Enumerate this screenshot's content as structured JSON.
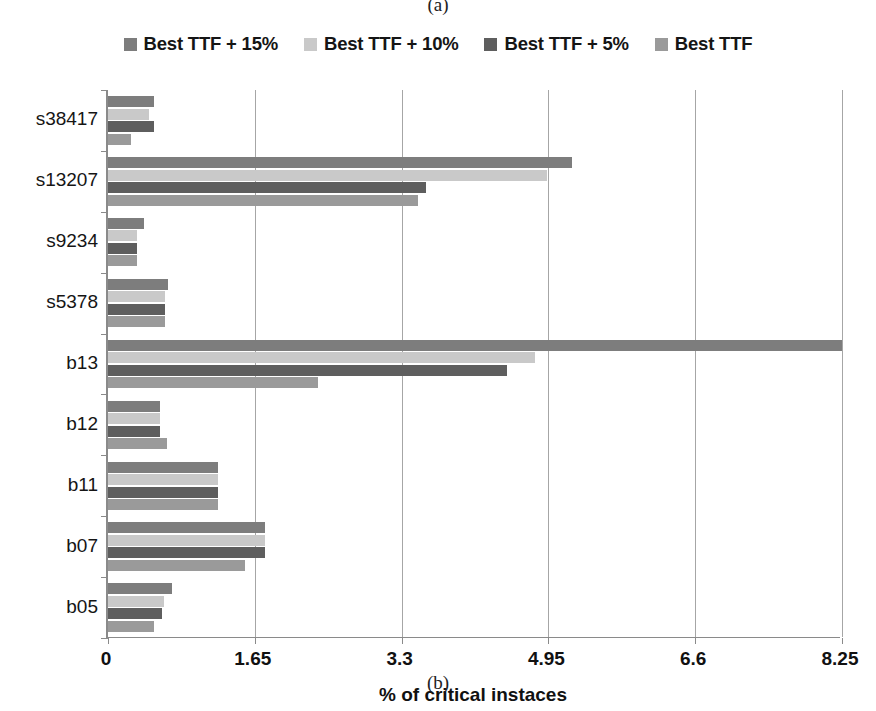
{
  "figure": {
    "caption_top": "(a)",
    "caption_bottom": "(b)"
  },
  "legend": {
    "position": "top-center",
    "items": [
      {
        "label": "Best TTF + 15%",
        "color": "#7d7d7d"
      },
      {
        "label": "Best TTF + 10%",
        "color": "#c9c9c9"
      },
      {
        "label": "Best TTF + 5%",
        "color": "#5e5e5e"
      },
      {
        "label": "Best TTF",
        "color": "#9a9a9a"
      }
    ]
  },
  "axes": {
    "x_title": "% of critical instaces",
    "x_ticks": [
      "0",
      "1.65",
      "3.3",
      "4.95",
      "6.6",
      "8.25"
    ],
    "x_tick_values": [
      0,
      1.65,
      3.3,
      4.95,
      6.6,
      8.25
    ],
    "y_categories": [
      "s38417",
      "s13207",
      "s9234",
      "s5378",
      "b13",
      "b12",
      "b11",
      "b07",
      "b05"
    ]
  },
  "chart_data": {
    "type": "bar",
    "orientation": "horizontal",
    "title": "",
    "subtitle": "",
    "xlabel": "% of critical instaces",
    "ylabel": "",
    "xlim": [
      0,
      8.25
    ],
    "grid": true,
    "legend_position": "top",
    "categories": [
      "s38417",
      "s13207",
      "s9234",
      "s5378",
      "b13",
      "b12",
      "b11",
      "b07",
      "b05"
    ],
    "series": [
      {
        "name": "Best TTF + 15%",
        "color": "#7d7d7d",
        "values": [
          0.52,
          5.21,
          0.4,
          0.68,
          8.25,
          0.59,
          1.24,
          1.76,
          0.72
        ]
      },
      {
        "name": "Best TTF + 10%",
        "color": "#c9c9c9",
        "values": [
          0.46,
          4.93,
          0.33,
          0.64,
          4.8,
          0.59,
          1.24,
          1.76,
          0.63
        ]
      },
      {
        "name": "Best TTF + 5%",
        "color": "#5e5e5e",
        "values": [
          0.52,
          3.57,
          0.33,
          0.64,
          4.48,
          0.59,
          1.24,
          1.76,
          0.61
        ]
      },
      {
        "name": "Best TTF",
        "color": "#9a9a9a",
        "values": [
          0.26,
          3.48,
          0.33,
          0.64,
          2.36,
          0.66,
          1.24,
          1.54,
          0.52
        ]
      }
    ]
  },
  "colors": {
    "axis": "#8a8a8a",
    "grid": "#a6a6a6",
    "text": "#151515",
    "background": "#ffffff"
  }
}
